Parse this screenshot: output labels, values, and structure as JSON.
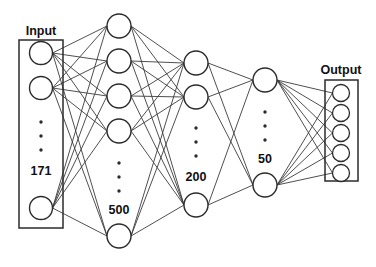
{
  "figure": {
    "type": "neural-network-architecture-diagram",
    "background_color": "#ffffff",
    "stroke_color": "#2b2b2b",
    "edge_color": "#3b3b3b",
    "node_fill": "#ffffff"
  },
  "layers": [
    {
      "id": "input",
      "group_label": "Input",
      "size_label": "171",
      "boxed": true,
      "visible_nodes": 3,
      "has_ellipsis": true,
      "node_radius": 11.5,
      "center_x": 41,
      "node_y": [
        53,
        88,
        208
      ],
      "ellipsis_y": [
        122,
        136,
        150
      ],
      "size_label_pos": {
        "x": 41,
        "y": 172
      },
      "group_label_pos": {
        "x": 41,
        "y": 32
      },
      "box": {
        "x": 19,
        "y": 40,
        "width": 44,
        "height": 188
      }
    },
    {
      "id": "hidden1",
      "group_label": "",
      "size_label": "500",
      "boxed": false,
      "visible_nodes": 5,
      "has_ellipsis": true,
      "node_radius": 12,
      "center_x": 119,
      "node_y": [
        26,
        61,
        96,
        131,
        236
      ],
      "ellipsis_y": [
        163,
        177,
        191
      ],
      "size_label_pos": {
        "x": 119,
        "y": 211
      }
    },
    {
      "id": "hidden2",
      "group_label": "",
      "size_label": "200",
      "boxed": false,
      "visible_nodes": 3,
      "has_ellipsis": true,
      "node_radius": 12,
      "center_x": 196,
      "node_y": [
        63,
        97,
        205
      ],
      "ellipsis_y": [
        128,
        142,
        156
      ],
      "size_label_pos": {
        "x": 196,
        "y": 178
      }
    },
    {
      "id": "hidden3",
      "group_label": "",
      "size_label": "50",
      "boxed": false,
      "visible_nodes": 2,
      "has_ellipsis": true,
      "node_radius": 12,
      "center_x": 265,
      "node_y": [
        80,
        185
      ],
      "ellipsis_y": [
        112,
        126,
        140
      ],
      "size_label_pos": {
        "x": 265,
        "y": 160
      }
    },
    {
      "id": "output",
      "group_label": "Output",
      "size_label": "",
      "boxed": true,
      "visible_nodes": 5,
      "has_ellipsis": false,
      "node_radius": 8.5,
      "center_x": 341,
      "node_y": [
        93,
        113,
        133,
        153,
        173
      ],
      "ellipsis_y": [],
      "group_label_pos": {
        "x": 341,
        "y": 71
      },
      "box": {
        "x": 325,
        "y": 80,
        "width": 33,
        "height": 101
      }
    }
  ],
  "connections": [
    {
      "from": "input",
      "to": "hidden1",
      "style": "fully-connected"
    },
    {
      "from": "hidden1",
      "to": "hidden2",
      "style": "fully-connected"
    },
    {
      "from": "hidden2",
      "to": "hidden3",
      "style": "fully-connected"
    },
    {
      "from": "hidden3",
      "to": "output",
      "style": "fully-connected"
    }
  ],
  "labels": {
    "input": "Input",
    "input_size": "171",
    "hidden1_size": "500",
    "hidden2_size": "200",
    "hidden3_size": "50",
    "output": "Output"
  }
}
